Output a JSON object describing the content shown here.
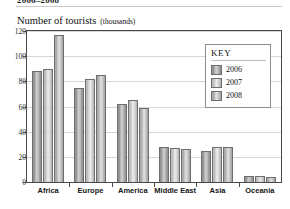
{
  "header": {
    "clipped_title": "2006–2008",
    "axis_title_main": "Number of tourists",
    "axis_title_sub": "(thousands)"
  },
  "legend": {
    "title": "KEY",
    "entries": [
      {
        "label": "2006",
        "swatch": "legend-swatch-2006"
      },
      {
        "label": "2007",
        "swatch": "legend-swatch-2007"
      },
      {
        "label": "2008",
        "swatch": "legend-swatch-2008"
      }
    ]
  },
  "chart_data": {
    "type": "bar",
    "title": "Number of tourists (thousands)",
    "subtitle": "2006–2008",
    "xlabel": "",
    "ylabel": "Number of tourists (thousands)",
    "ylim": [
      0,
      120
    ],
    "yticks": [
      0,
      20,
      40,
      60,
      80,
      100,
      120
    ],
    "grid": true,
    "legend_position": "inside-top-right",
    "categories": [
      "Africa",
      "Europe",
      "America",
      "Middle East",
      "Asia",
      "Oceania"
    ],
    "series": [
      {
        "name": "2006",
        "values": [
          88,
          75,
          62,
          28,
          25,
          5
        ]
      },
      {
        "name": "2007",
        "values": [
          90,
          82,
          65,
          27,
          28,
          5
        ]
      },
      {
        "name": "2008",
        "values": [
          117,
          85,
          59,
          26,
          28,
          4
        ]
      }
    ],
    "colors": {
      "2006": "#9a9a9a",
      "2007": "#d6d6d6",
      "2008": "#bcbcbc",
      "axis": "#4a4a4a",
      "grid": "#d6d6d6"
    }
  }
}
